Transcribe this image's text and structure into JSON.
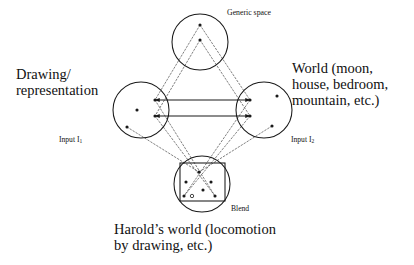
{
  "figure": {
    "type": "conceptual-blending-network",
    "title_visible": false,
    "background_color": "#ffffff",
    "stroke_color": "#1a1a1a"
  },
  "labels": {
    "generic_space": "Generic space",
    "blend": "Blend",
    "input1": "Input I",
    "input1_sub": "1",
    "input2": "Input I",
    "input2_sub": "2",
    "left_line1": "Drawing/",
    "left_line2": "representation",
    "right_line1": "World (moon,",
    "right_line2": "house, bedroom,",
    "right_line3": "mountain, etc.)",
    "bottom_line1": "Harold’s world (locomotion",
    "bottom_line2": "by drawing, etc.)"
  },
  "spaces": [
    {
      "name": "generic-space",
      "role": "generic",
      "cx": 200,
      "cy": 42,
      "r": 28,
      "dots": [
        [
          200,
          25
        ],
        [
          200,
          40
        ]
      ]
    },
    {
      "name": "input-space-1",
      "role": "input",
      "cx": 141,
      "cy": 110,
      "r": 28,
      "dots": [
        [
          137,
          110
        ],
        [
          127,
          127
        ],
        [
          155,
          100
        ],
        [
          155,
          116
        ]
      ]
    },
    {
      "name": "input-space-2",
      "role": "input",
      "cx": 264,
      "cy": 110,
      "r": 28,
      "dots": [
        [
          277,
          96
        ],
        [
          250,
          100
        ],
        [
          250,
          116
        ],
        [
          272,
          126
        ]
      ]
    },
    {
      "name": "blend-space",
      "role": "blend",
      "cx": 202,
      "cy": 184,
      "r": 28,
      "dots": [
        [
          199,
          172
        ],
        [
          186,
          182
        ],
        [
          211,
          182
        ],
        [
          203,
          190
        ],
        [
          184,
          196
        ],
        [
          215,
          196
        ]
      ],
      "open_dots": [
        [
          192,
          196
        ]
      ],
      "square": {
        "x": 180,
        "y": 163,
        "w": 45,
        "h": 38
      }
    }
  ],
  "solid_connectors": [
    {
      "name": "cross-space-mapping-upper",
      "x1": 155,
      "y1": 100,
      "x2": 250,
      "y2": 100,
      "arrows": "both"
    },
    {
      "name": "cross-space-mapping-lower",
      "x1": 155,
      "y1": 116,
      "x2": 250,
      "y2": 116,
      "arrows": "both"
    }
  ],
  "dotted_projections": [
    {
      "from": [
        200,
        25
      ],
      "to": [
        155,
        100
      ]
    },
    {
      "from": [
        200,
        25
      ],
      "to": [
        250,
        100
      ]
    },
    {
      "from": [
        200,
        40
      ],
      "to": [
        155,
        116
      ]
    },
    {
      "from": [
        200,
        40
      ],
      "to": [
        250,
        116
      ]
    },
    {
      "from": [
        155,
        100
      ],
      "to": [
        215,
        196
      ]
    },
    {
      "from": [
        155,
        116
      ],
      "to": [
        215,
        196
      ]
    },
    {
      "from": [
        250,
        100
      ],
      "to": [
        184,
        196
      ]
    },
    {
      "from": [
        250,
        116
      ],
      "to": [
        184,
        196
      ]
    },
    {
      "from": [
        127,
        127
      ],
      "to": [
        199,
        172
      ]
    },
    {
      "from": [
        272,
        126
      ],
      "to": [
        199,
        172
      ]
    }
  ],
  "colors": {
    "ink": "#1a1a1a",
    "dotted": "#555555",
    "paper": "#ffffff"
  }
}
